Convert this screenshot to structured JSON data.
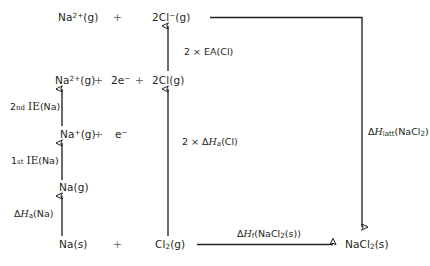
{
  "diagram": {
    "type": "born-haber-cycle",
    "stroke_color": "#231f20",
    "plus_color": "#6d6e71",
    "background": "#ffffff",
    "species": {
      "na2plus_g_top": "Na²⁺(g)",
      "cl_minus_2_g": "2Cl⁻(g)",
      "na2plus_g": "Na²⁺(g)",
      "two_e_minus": "2e⁻",
      "cl_2_g_atoms": "2Cl(g)",
      "naplus_g": "Na⁺(g)",
      "e_minus": "e⁻",
      "na_g": "Na(g)",
      "na_s": "Na(s)",
      "cl2_g": "Cl₂(g)",
      "nacl2_s": "NaCl₂(s)"
    },
    "plus_signs": [
      "+",
      "+",
      "+",
      "+",
      "+"
    ],
    "enthalpy_labels": {
      "second_ie": "2nd IE(Na)",
      "first_ie": "1st IE(Na)",
      "atomisation_na": "ΔHa(Na)",
      "electron_affinity": "2 × EA(Cl)",
      "atomisation_cl": "2 × ΔHa(Cl)",
      "lattice": "ΔHlatt(NaCl₂)",
      "formation": "ΔHf(NaCl₂(s))"
    }
  }
}
